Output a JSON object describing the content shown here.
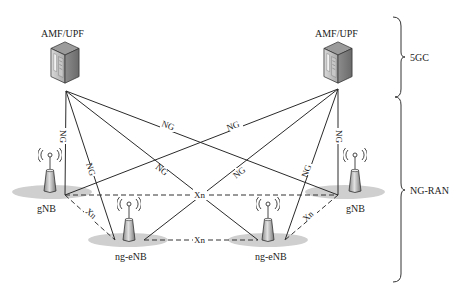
{
  "diagram": {
    "core": {
      "left_node_label": "AMF/UPF",
      "right_node_label": "AMF/UPF",
      "icon": "server-icon"
    },
    "ran": {
      "gnb_left_label": "gNB",
      "gnb_right_label": "gNB",
      "ngenb_left_label": "ng-eNB",
      "ngenb_right_label": "ng-eNB",
      "icon": "base-station-antenna-icon"
    },
    "interfaces": {
      "ng": "NG",
      "xn": "Xn"
    },
    "groups": {
      "core_label": "5GC",
      "ran_label": "NG-RAN"
    },
    "links": [
      {
        "from": "AMF/UPF (left)",
        "to": "gNB (left)",
        "type": "NG"
      },
      {
        "from": "AMF/UPF (left)",
        "to": "ng-eNB (left)",
        "type": "NG"
      },
      {
        "from": "AMF/UPF (left)",
        "to": "ng-eNB (right)",
        "type": "NG"
      },
      {
        "from": "AMF/UPF (left)",
        "to": "gNB (right)",
        "type": "NG"
      },
      {
        "from": "AMF/UPF (right)",
        "to": "gNB (right)",
        "type": "NG"
      },
      {
        "from": "AMF/UPF (right)",
        "to": "ng-eNB (right)",
        "type": "NG"
      },
      {
        "from": "AMF/UPF (right)",
        "to": "ng-eNB (left)",
        "type": "NG"
      },
      {
        "from": "AMF/UPF (right)",
        "to": "gNB (left)",
        "type": "NG"
      },
      {
        "from": "gNB (left)",
        "to": "gNB (right)",
        "type": "Xn"
      },
      {
        "from": "ng-eNB (left)",
        "to": "ng-eNB (right)",
        "type": "Xn"
      },
      {
        "from": "gNB (left)",
        "to": "ng-eNB (left)",
        "type": "Xn"
      },
      {
        "from": "gNB (right)",
        "to": "ng-eNB (right)",
        "type": "Xn"
      }
    ]
  }
}
